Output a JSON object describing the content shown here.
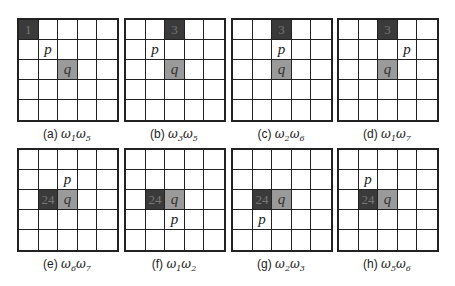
{
  "figure": {
    "panels": [
      {
        "id": "a",
        "caption_prefix": "(a)",
        "omega": [
          "1",
          "5"
        ],
        "dark": {
          "row": 0,
          "col": 0,
          "label": "1"
        },
        "p": {
          "row": 1,
          "col": 1
        },
        "q": {
          "row": 2,
          "col": 2
        },
        "left": 17,
        "top": 18
      },
      {
        "id": "b",
        "caption_prefix": "(b)",
        "omega": [
          "3",
          "5"
        ],
        "dark": {
          "row": 0,
          "col": 2,
          "label": "3"
        },
        "p": {
          "row": 1,
          "col": 1
        },
        "q": {
          "row": 2,
          "col": 2
        },
        "left": 124,
        "top": 18
      },
      {
        "id": "c",
        "caption_prefix": "(c)",
        "omega": [
          "2",
          "6"
        ],
        "dark": {
          "row": 0,
          "col": 2,
          "label": "3"
        },
        "p": {
          "row": 1,
          "col": 2
        },
        "q": {
          "row": 2,
          "col": 2
        },
        "left": 231,
        "top": 18
      },
      {
        "id": "d",
        "caption_prefix": "(d)",
        "omega": [
          "1",
          "7"
        ],
        "dark": {
          "row": 0,
          "col": 2,
          "label": "3"
        },
        "p": {
          "row": 1,
          "col": 3
        },
        "q": {
          "row": 2,
          "col": 2
        },
        "left": 337,
        "top": 18
      },
      {
        "id": "e",
        "caption_prefix": "(e)",
        "omega": [
          "6",
          "7"
        ],
        "dark": {
          "row": 2,
          "col": 1,
          "label": "24"
        },
        "p": {
          "row": 1,
          "col": 2
        },
        "q": {
          "row": 2,
          "col": 2
        },
        "left": 17,
        "top": 148
      },
      {
        "id": "f",
        "caption_prefix": "(f)",
        "omega": [
          "1",
          "2"
        ],
        "dark": {
          "row": 2,
          "col": 1,
          "label": "24"
        },
        "p": {
          "row": 3,
          "col": 2
        },
        "q": {
          "row": 2,
          "col": 2
        },
        "left": 124,
        "top": 148
      },
      {
        "id": "g",
        "caption_prefix": "(g)",
        "omega": [
          "2",
          "3"
        ],
        "dark": {
          "row": 2,
          "col": 1,
          "label": "24"
        },
        "p": {
          "row": 3,
          "col": 1
        },
        "q": {
          "row": 2,
          "col": 2
        },
        "left": 231,
        "top": 148
      },
      {
        "id": "h",
        "caption_prefix": "(h)",
        "omega": [
          "5",
          "6"
        ],
        "dark": {
          "row": 2,
          "col": 1,
          "label": "24"
        },
        "p": {
          "row": 1,
          "col": 1
        },
        "q": {
          "row": 2,
          "col": 2
        },
        "left": 337,
        "top": 148
      }
    ],
    "p_label": "p",
    "q_label": "q",
    "omega_symbol": "ω",
    "colors": {
      "dark": "#3a3a3a",
      "mid": "#9a9a9a",
      "line": "#222222"
    }
  }
}
